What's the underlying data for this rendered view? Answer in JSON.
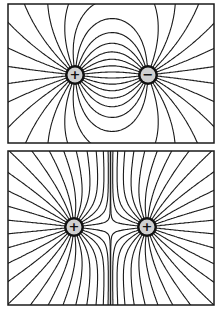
{
  "diagram": {
    "colors": {
      "line": "#1a1a1a",
      "background": "#ffffff",
      "charge_fill": "#d0d0d0",
      "frame": "#1a1a1a"
    },
    "panels": [
      {
        "name": "opposite-charges",
        "frame": {
          "x": 8,
          "y": 4,
          "w": 206,
          "h": 139
        },
        "charges": [
          {
            "sign": "+",
            "x": 75,
            "y": 75
          },
          {
            "sign": "−",
            "x": 148,
            "y": 75
          }
        ]
      },
      {
        "name": "like-charges",
        "frame": {
          "x": 8,
          "y": 151,
          "w": 206,
          "h": 154
        },
        "charges": [
          {
            "sign": "+",
            "x": 74,
            "y": 227
          },
          {
            "sign": "+",
            "x": 147,
            "y": 227
          }
        ]
      }
    ]
  }
}
